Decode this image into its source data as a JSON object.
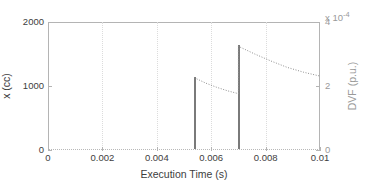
{
  "chart_data": {
    "type": "line",
    "title": "",
    "xlabel": "Execution Time (s)",
    "ylabel_left": "x (cc)",
    "ylabel_right": "DVF (p.u.)",
    "right_axis_multiplier": "x 10",
    "right_axis_exponent": "-4",
    "xlim": [
      0,
      0.01
    ],
    "ylim_left": [
      0,
      2000
    ],
    "ylim_right": [
      0,
      0.0004
    ],
    "xticks": [
      0,
      0.002,
      0.004,
      0.006,
      0.008,
      0.01
    ],
    "xticklabels": [
      "0",
      "0.002",
      "0.004",
      "0.006",
      "0.008",
      "0.01"
    ],
    "yticks_left": [
      0,
      1000,
      2000
    ],
    "yticklabels_left": [
      "0",
      "1000",
      "2000"
    ],
    "yticks_right": [
      0,
      2,
      4
    ],
    "yticklabels_right": [
      "0",
      "2",
      "4"
    ],
    "grid": "vertical-dotted",
    "legend": "none",
    "series": [
      {
        "name": "x (cc)",
        "axis": "left",
        "style": "solid-impulse",
        "color": "#7a7a7a",
        "points": [
          {
            "x": 0.00538,
            "y": 1130
          },
          {
            "x": 0.007,
            "y": 1620
          }
        ]
      },
      {
        "name": "DVF (p.u.)",
        "axis": "right",
        "style": "dotted-line",
        "color": "#8f8f8f",
        "segments": [
          {
            "name": "decay-1",
            "x": [
              0.00538,
              0.0058,
              0.0062,
              0.0066,
              0.007
            ],
            "y": [
              0.000226,
              0.000209,
              0.000196,
              0.000185,
              0.000176
            ]
          },
          {
            "name": "decay-2",
            "x": [
              0.007,
              0.007,
              0.0076,
              0.0082,
              0.0088,
              0.0094,
              0.01
            ],
            "y": [
              0.000176,
              0.000324,
              0.0003,
              0.000278,
              0.000258,
              0.000243,
              0.000231
            ]
          }
        ]
      }
    ]
  },
  "axes": {
    "x_tick_labels": [
      "0",
      "0.002",
      "0.004",
      "0.006",
      "0.008",
      "0.01"
    ],
    "y_left_tick_labels": [
      "0",
      "1000",
      "2000"
    ],
    "y_right_tick_labels": [
      "0",
      "2",
      "4"
    ],
    "x_title": "Execution Time (s)",
    "y_left_title": "x (cc)",
    "y_right_title": "DVF (p.u.)",
    "right_multiplier_base": "x 10",
    "right_multiplier_exp": "-4"
  },
  "colors": {
    "axis": "#b4b4b4",
    "grid": "#dcdcdc",
    "left_series": "#7a7a7a",
    "right_series": "#8f8f8f",
    "left_text": "#3d3d3d",
    "right_text": "#9a9a9a",
    "background": "#ffffff"
  }
}
